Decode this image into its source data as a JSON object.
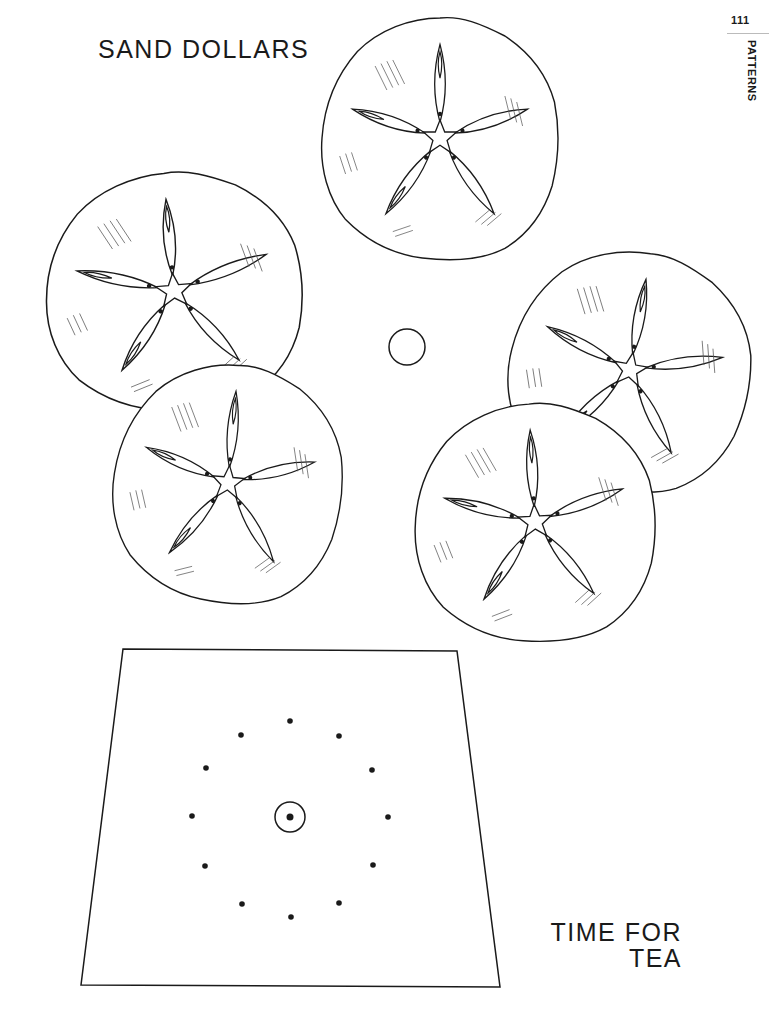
{
  "page": {
    "number": "111",
    "section_label": "PATTERNS"
  },
  "patterns": {
    "sand_dollars": {
      "title": "SAND DOLLARS",
      "items": [
        {
          "id": "sand-dollar-top",
          "cx": 440,
          "cy": 138,
          "rx": 118,
          "ry": 120,
          "rot": 0
        },
        {
          "id": "sand-dollar-left-upper",
          "cx": 174,
          "cy": 291,
          "rx": 128,
          "ry": 118,
          "rot": -5
        },
        {
          "id": "sand-dollar-left-lower",
          "cx": 228,
          "cy": 483,
          "rx": 114,
          "ry": 118,
          "rot": 5
        },
        {
          "id": "sand-dollar-right-upper",
          "cx": 630,
          "cy": 370,
          "rx": 120,
          "ry": 118,
          "rot": 10
        },
        {
          "id": "sand-dollar-right-lower",
          "cx": 535,
          "cy": 522,
          "rx": 120,
          "ry": 118,
          "rot": -3
        }
      ],
      "small_circle": {
        "cx": 407,
        "cy": 347,
        "r": 18
      }
    },
    "time_for_tea": {
      "title_line1": "TIME FOR",
      "title_line2": "TEA",
      "trapezoid": [
        [
          123,
          649
        ],
        [
          457,
          651
        ],
        [
          500,
          987
        ],
        [
          81,
          985
        ]
      ],
      "center": {
        "cx": 290,
        "cy": 817,
        "r": 15
      },
      "dots": [
        [
          290,
          721
        ],
        [
          241,
          735
        ],
        [
          339,
          736
        ],
        [
          206,
          768
        ],
        [
          372,
          770
        ],
        [
          192,
          816
        ],
        [
          388,
          817
        ],
        [
          205,
          866
        ],
        [
          373,
          865
        ],
        [
          242,
          904
        ],
        [
          339,
          903
        ],
        [
          291,
          917
        ]
      ]
    }
  }
}
